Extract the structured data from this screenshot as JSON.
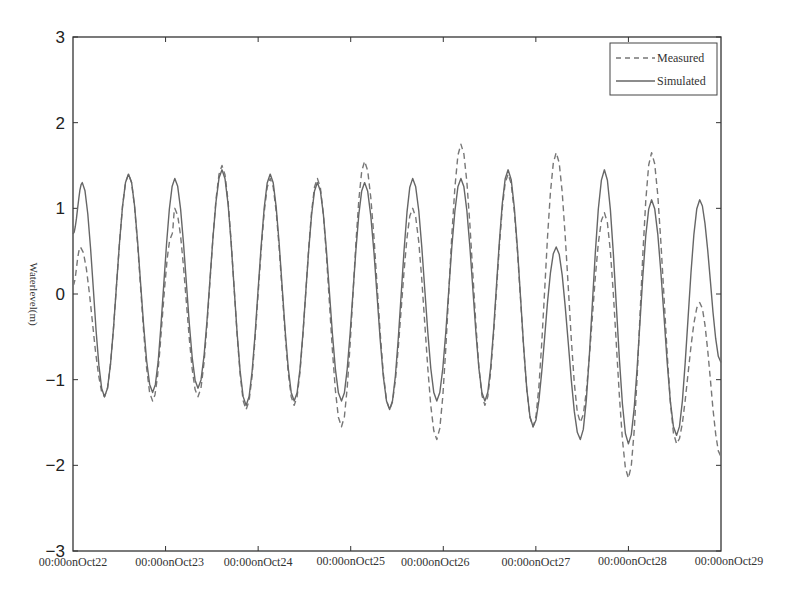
{
  "chart_data": {
    "type": "line",
    "title": "",
    "xlabel": "",
    "ylabel": "Waterlevel(m)",
    "ylim": [
      -3,
      3
    ],
    "yticks": [
      3,
      2,
      1,
      0,
      -1,
      -2,
      -3
    ],
    "ytick_labels": [
      "3",
      "2",
      "1",
      "0",
      "−1",
      "−2",
      "−3"
    ],
    "xlim_days": [
      0,
      7
    ],
    "xtick_labels": [
      "00:00onOct22",
      "00:00onOct23",
      "00:00onOct24",
      "00:00onOct25",
      "00:00onOct26",
      "00:00onOct27",
      "00:00onOct28",
      "00:00onOct29"
    ],
    "grid": false,
    "legend_position": "upper right",
    "legend": [
      "Measured",
      "Simulated"
    ],
    "series": [
      {
        "name": "Measured",
        "style": "dashed",
        "color": "#777777",
        "x_days": [
          0.0,
          0.08,
          0.34,
          0.6,
          0.86,
          1.07,
          1.1,
          1.35,
          1.61,
          1.87,
          2.13,
          2.39,
          2.64,
          2.9,
          3.15,
          3.42,
          3.67,
          3.93,
          4.19,
          4.45,
          4.7,
          4.97,
          5.22,
          5.48,
          5.74,
          6.0,
          6.25,
          6.52,
          6.77,
          7.0
        ],
        "values": [
          0.1,
          0.55,
          -1.2,
          1.4,
          -1.25,
          0.7,
          1.0,
          -1.2,
          1.5,
          -1.35,
          1.35,
          -1.3,
          1.35,
          -1.55,
          1.55,
          -1.35,
          1.0,
          -1.7,
          1.75,
          -1.3,
          1.4,
          -1.55,
          1.65,
          -1.5,
          0.95,
          -2.15,
          1.65,
          -1.75,
          -0.1,
          -1.9
        ]
      },
      {
        "name": "Simulated",
        "style": "solid",
        "color": "#666666",
        "x_days": [
          0.0,
          0.1,
          0.34,
          0.6,
          0.86,
          1.1,
          1.35,
          1.61,
          1.87,
          2.13,
          2.39,
          2.64,
          2.9,
          3.15,
          3.42,
          3.67,
          3.93,
          4.19,
          4.45,
          4.7,
          4.97,
          5.22,
          5.48,
          5.74,
          6.0,
          6.25,
          6.52,
          6.77,
          7.0
        ],
        "values": [
          0.7,
          1.3,
          -1.2,
          1.4,
          -1.15,
          1.35,
          -1.1,
          1.45,
          -1.3,
          1.4,
          -1.25,
          1.3,
          -1.25,
          1.3,
          -1.35,
          1.35,
          -1.25,
          1.35,
          -1.25,
          1.45,
          -1.55,
          0.55,
          -1.7,
          1.45,
          -1.75,
          1.1,
          -1.65,
          1.1,
          -0.8
        ]
      }
    ]
  },
  "legend": {
    "measured_label": "Measured",
    "simulated_label": "Simulated"
  },
  "axes": {
    "ylabel": "Waterlevel(m)"
  }
}
